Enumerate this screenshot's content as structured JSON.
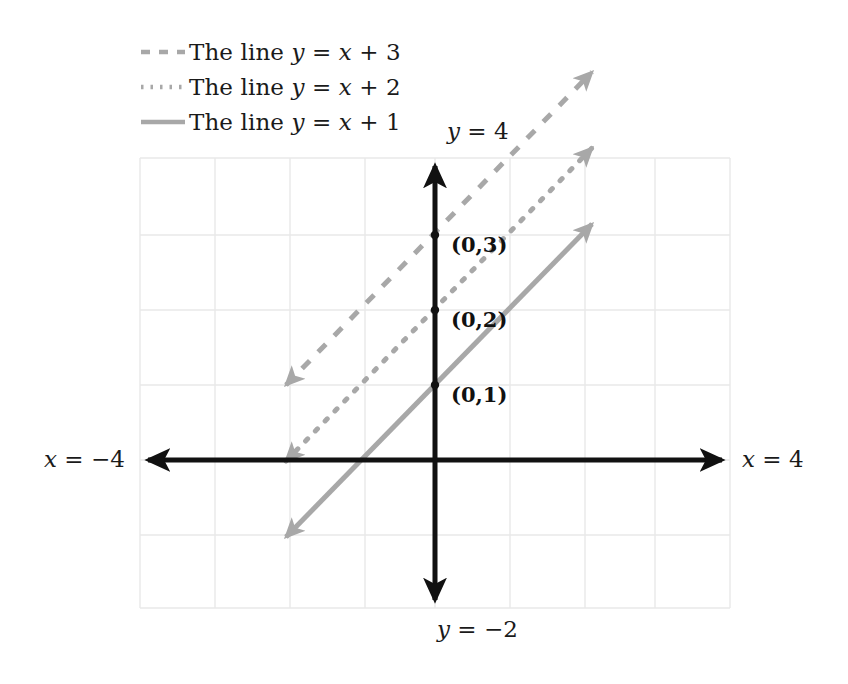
{
  "chart_data": {
    "type": "line",
    "title": "",
    "xlabel": "",
    "ylabel": "",
    "xlim": [
      -4,
      4
    ],
    "ylim": [
      -2,
      4
    ],
    "grid": true,
    "grid_step": 1,
    "legend_position": "top-left",
    "axis_end_labels": {
      "x_min": "x = −4",
      "x_max": "x = 4",
      "y_max": "y = 4",
      "y_min": "y = −2"
    },
    "annotations": [
      {
        "label": "(0,3)",
        "x": 0,
        "y": 3
      },
      {
        "label": "(0,2)",
        "x": 0,
        "y": 2
      },
      {
        "label": "(0,1)",
        "x": 0,
        "y": 1
      }
    ],
    "series": [
      {
        "name": "The line y = x + 3",
        "equation": "y = x + 3",
        "slope": 1,
        "intercept": 3,
        "style": "dashed",
        "color": "#a8a8a8",
        "x": [
          -2,
          2.1
        ],
        "values": [
          1,
          5.1
        ]
      },
      {
        "name": "The line y = x + 2",
        "equation": "y = x + 2",
        "slope": 1,
        "intercept": 2,
        "style": "dotted",
        "color": "#a8a8a8",
        "x": [
          -2,
          2.1
        ],
        "values": [
          0,
          4.1
        ]
      },
      {
        "name": "The line y = x + 1",
        "equation": "y = x + 1",
        "slope": 1,
        "intercept": 1,
        "style": "solid",
        "color": "#a8a8a8",
        "x": [
          -2,
          2.1
        ],
        "values": [
          -1,
          3.1
        ]
      }
    ]
  },
  "legend": {
    "items": [
      {
        "label": "The line y = x + 3",
        "style": "dashed"
      },
      {
        "label": "The line y = x + 2",
        "style": "dotted"
      },
      {
        "label": "The line y = x + 1",
        "style": "solid"
      }
    ]
  },
  "axes": {
    "x_left_label": "x = −4",
    "x_right_label": "x = 4",
    "y_top_label": "y = 4",
    "y_bottom_label": "y = −2"
  },
  "points": {
    "p3": "(0,3)",
    "p2": "(0,2)",
    "p1": "(0,1)"
  },
  "colors": {
    "axis": "#111111",
    "grid": "#e9e9e9",
    "line": "#a8a8a8",
    "text": "#1a1a1a"
  }
}
